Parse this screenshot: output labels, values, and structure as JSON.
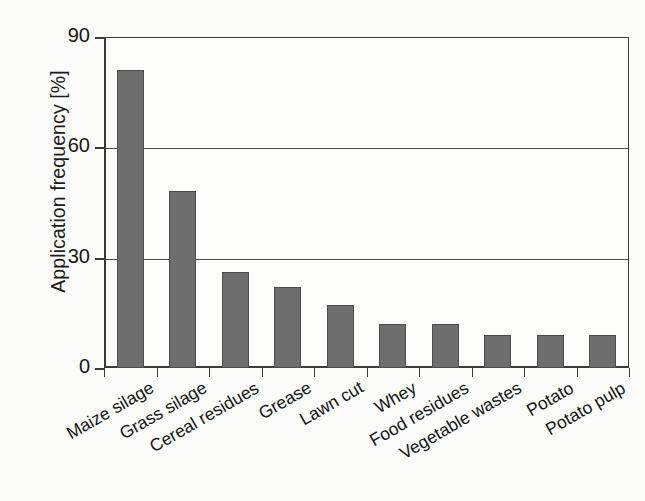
{
  "chart_data": {
    "type": "bar",
    "title": "",
    "subtitle": "",
    "xlabel": "",
    "ylabel": "Application frequency [%]",
    "categories": [
      "Maize silage",
      "Grass silage",
      "Cereal residues",
      "Grease",
      "Lawn cut",
      "Whey",
      "Food residues",
      "Vegetable wastes",
      "Potato",
      "Potato pulp"
    ],
    "values": [
      81,
      48,
      26,
      22,
      17,
      12,
      12,
      9,
      9,
      9
    ],
    "ylim": [
      0,
      90
    ],
    "yticks": [
      0,
      30,
      60,
      90
    ],
    "ytick_labels": [
      "0",
      "30",
      "60",
      "90"
    ],
    "grid": "horizontal",
    "legend": "none",
    "bar_color": "#6e6e6e",
    "bar_edge_color": "#4c4c4c",
    "axis_color": "#3a3a3a",
    "background_color": "#fdfdfc"
  }
}
